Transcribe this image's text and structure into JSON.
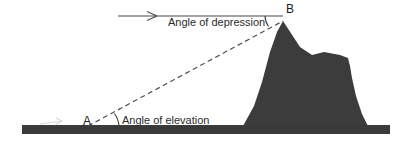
{
  "diagram": {
    "background_color": "#ffffff",
    "terrain_color": "#3c3c3c",
    "ground_color": "#3a3a3a",
    "line_color": "#4a4a4a",
    "text_color": "#2b2b2b",
    "labels": {
      "angle_of_depression": "Angle of depression",
      "angle_of_elevation": "Angle of elevation",
      "point_a": "A",
      "point_b": "B"
    },
    "elements": {
      "horizontal_ray_name": "horizontal-reference-line",
      "sight_line_name": "line-of-sight-dashed",
      "ground_name": "ground-line",
      "mountain_name": "mountain-silhouette"
    }
  },
  "geometry": {
    "point_a": {
      "x": 95,
      "y": 125
    },
    "point_b": {
      "x": 283,
      "y": 21
    },
    "horizontal_ray": {
      "x1": 118,
      "y1": 16,
      "x2": 283,
      "y2": 16
    },
    "ground_bar": {
      "x": 22,
      "y": 125,
      "width": 368,
      "height": 9
    }
  }
}
